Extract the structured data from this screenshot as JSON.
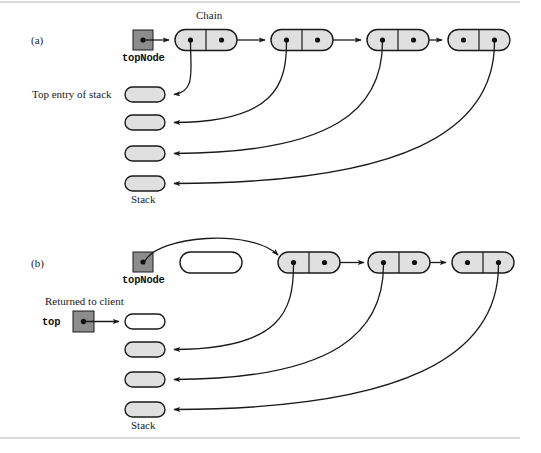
{
  "figure": {
    "background": "#ffffff",
    "node_fill": "#e0e0e0",
    "node_stroke": "#1a1a1a",
    "pointer_box_fill": "#8c8c8c",
    "pointer_box_stroke": "#1a1a1a",
    "empty_fill": "#ffffff",
    "arrow_color": "#1a1a1a",
    "rule_color": "#b5b5b5"
  },
  "panels": [
    {
      "id": "a",
      "label": "(a)",
      "chain_label": "Chain",
      "pointer_label": "topNode",
      "top_entry_label": "Top entry of stack",
      "stack_label": "Stack",
      "chain_nodes": [
        {
          "index": 0,
          "data_dot": true,
          "next_dot": true,
          "detached": false
        },
        {
          "index": 1,
          "data_dot": true,
          "next_dot": true,
          "detached": false
        },
        {
          "index": 2,
          "data_dot": true,
          "next_dot": true,
          "detached": false
        },
        {
          "index": 3,
          "data_dot": true,
          "next_dot": true,
          "detached": false
        }
      ],
      "stack_entries": [
        {
          "index": 0,
          "filled": true
        },
        {
          "index": 1,
          "filled": true
        },
        {
          "index": 2,
          "filled": true
        },
        {
          "index": 3,
          "filled": true
        }
      ]
    },
    {
      "id": "b",
      "label": "(b)",
      "pointer_label": "topNode",
      "returned_label": "Returned to client",
      "top_label": "top",
      "stack_label": "Stack",
      "detached_node": {
        "filled": false
      },
      "chain_nodes": [
        {
          "index": 0,
          "data_dot": true,
          "next_dot": true,
          "detached": false
        },
        {
          "index": 1,
          "data_dot": true,
          "next_dot": true,
          "detached": false
        },
        {
          "index": 2,
          "data_dot": true,
          "next_dot": true,
          "detached": false
        }
      ],
      "stack_entries": [
        {
          "index": 0,
          "filled": false
        },
        {
          "index": 1,
          "filled": true
        },
        {
          "index": 2,
          "filled": true
        },
        {
          "index": 3,
          "filled": true
        }
      ]
    }
  ]
}
